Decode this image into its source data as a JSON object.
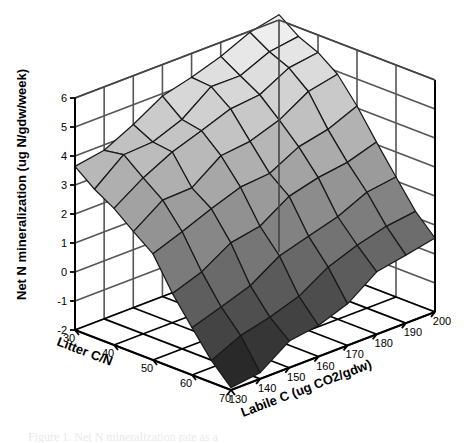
{
  "figure": {
    "caption_partial": "Figure 1. Net N mineralization rate as a",
    "background_color": "#ffffff"
  },
  "chart_data": {
    "type": "surface",
    "title": "",
    "xlabel": "Litter C/N",
    "ylabel": "Labile C (ug CO2/gdw)",
    "zlabel": "Net N mineralization (ug N/gdw/week)",
    "x": [
      30,
      35,
      40,
      45,
      50,
      55,
      60,
      65,
      70
    ],
    "y": [
      130,
      140,
      150,
      160,
      170,
      180,
      190,
      200
    ],
    "xticks": [
      30,
      40,
      50,
      60,
      70
    ],
    "yticks": [
      130,
      140,
      150,
      160,
      170,
      180,
      190,
      200
    ],
    "zticks": [
      -2,
      -1,
      0,
      1,
      2,
      3,
      4,
      5,
      6
    ],
    "xlim": [
      30,
      70
    ],
    "ylim": [
      130,
      200
    ],
    "zlim": [
      -2,
      6
    ],
    "grid": true,
    "legend": "none",
    "colormap": "grayscale",
    "colormap_light": "#f2f2f2",
    "colormap_dark": "#111111",
    "mesh_line_color": "#1a1a1a",
    "axis_line_color": "#000000",
    "wall_grid_color": "#555555",
    "z": [
      [
        3.6,
        3.9,
        4.3,
        4.7,
        5.1,
        5.5,
        5.8,
        6.0
      ],
      [
        3.3,
        3.7,
        4.1,
        4.5,
        4.9,
        5.3,
        5.6,
        5.9
      ],
      [
        2.9,
        3.3,
        3.7,
        4.1,
        4.5,
        4.9,
        5.2,
        5.4
      ],
      [
        2.3,
        2.7,
        3.1,
        3.5,
        3.9,
        4.3,
        4.6,
        4.8
      ],
      [
        1.5,
        1.9,
        2.3,
        2.7,
        3.1,
        3.5,
        3.8,
        4.0
      ],
      [
        0.6,
        1.0,
        1.4,
        1.8,
        2.2,
        2.6,
        2.9,
        3.1
      ],
      [
        -0.4,
        0.0,
        0.4,
        0.8,
        1.2,
        1.6,
        1.9,
        2.1
      ],
      [
        -1.2,
        -0.8,
        -0.4,
        0.0,
        0.4,
        0.8,
        1.1,
        1.3
      ],
      [
        -1.9,
        -1.6,
        -1.2,
        -0.8,
        -0.4,
        0.0,
        0.3,
        0.5
      ]
    ],
    "noise_seed": 7,
    "noise_amplitude": 0.22
  },
  "geometry": {
    "origin_x": 231,
    "origin_y": 390,
    "x_axis_dx": -156,
    "x_axis_dy": -60,
    "y_axis_dx": 204,
    "y_axis_dy": -78,
    "z_axis_dy": -232
  }
}
